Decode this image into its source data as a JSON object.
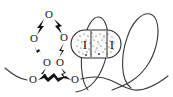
{
  "figure": {
    "width": 173,
    "height": 97,
    "background_color": "#ffffff",
    "line_color": "#3b3b3b",
    "ink_color": "#121212"
  },
  "crown_ring": {
    "description": "Hexagonal ring of oxygen atoms joined by zigzag bonds",
    "atom_label": "O",
    "atoms": [
      {
        "id": "o-top",
        "label": "O",
        "x": 49,
        "y": 14
      },
      {
        "id": "o-upper-right",
        "label": "O",
        "x": 64,
        "y": 37
      },
      {
        "id": "o-lower-right",
        "label": "O",
        "x": 60,
        "y": 62
      },
      {
        "id": "o-lower-left",
        "label": "O",
        "x": 47,
        "y": 62
      },
      {
        "id": "o-upper-left",
        "label": "O",
        "x": 34,
        "y": 38
      }
    ],
    "chain_atoms": [
      {
        "id": "o-chain-left",
        "label": "O",
        "x": 33,
        "y": 79
      },
      {
        "id": "o-chain-right",
        "label": "O",
        "x": 75,
        "y": 79
      }
    ],
    "bond_count": 7
  },
  "capsule": {
    "id": "stippled-capsule",
    "description": "Stadium-shaped stippled region containing two roman numeral labels",
    "labels": [
      {
        "id": "capsule-label-left",
        "text": "I",
        "x": 85,
        "y": 44
      },
      {
        "id": "capsule-label-right",
        "text": "I",
        "x": 112,
        "y": 44
      }
    ],
    "x": 71,
    "y": 30,
    "width": 50,
    "height": 28,
    "fill_color": "#fbfbfb",
    "stroke_color": "#2a2a2a",
    "texture": "stipple"
  },
  "loops": [
    {
      "id": "loop-center",
      "description": "Tall narrow loop threading through the capsule",
      "cx": 96,
      "cy": 46
    },
    {
      "id": "loop-right",
      "description": "Large right-hand loop crossing itself near the baseline",
      "cx": 140,
      "cy": 46
    }
  ],
  "threads": [
    {
      "id": "thread-left-tail",
      "description": "Curved tail entering from the left edge toward the chain oxygen"
    },
    {
      "id": "thread-right-tail",
      "description": "Curved tail exiting toward the right edge"
    }
  ],
  "legend": {
    "oxygen_symbol": "O",
    "macrocycle_symbol": "I"
  }
}
